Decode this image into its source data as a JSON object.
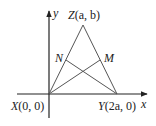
{
  "diagram": {
    "type": "coordinate-geometry",
    "axes": {
      "x_label": "x",
      "y_label": "y"
    },
    "points": {
      "X": {
        "name": "X",
        "coords": "(0, 0)"
      },
      "Y": {
        "name": "Y",
        "coords": "(2a, 0)"
      },
      "Z": {
        "name": "Z",
        "coords": "(a, b)"
      },
      "N": {
        "name": "N"
      },
      "M": {
        "name": "M"
      }
    },
    "segments": [
      "XZ",
      "YZ",
      "XM",
      "YN"
    ],
    "colors": {
      "line": "#555555",
      "axis": "#222222",
      "text": "#222222"
    }
  }
}
